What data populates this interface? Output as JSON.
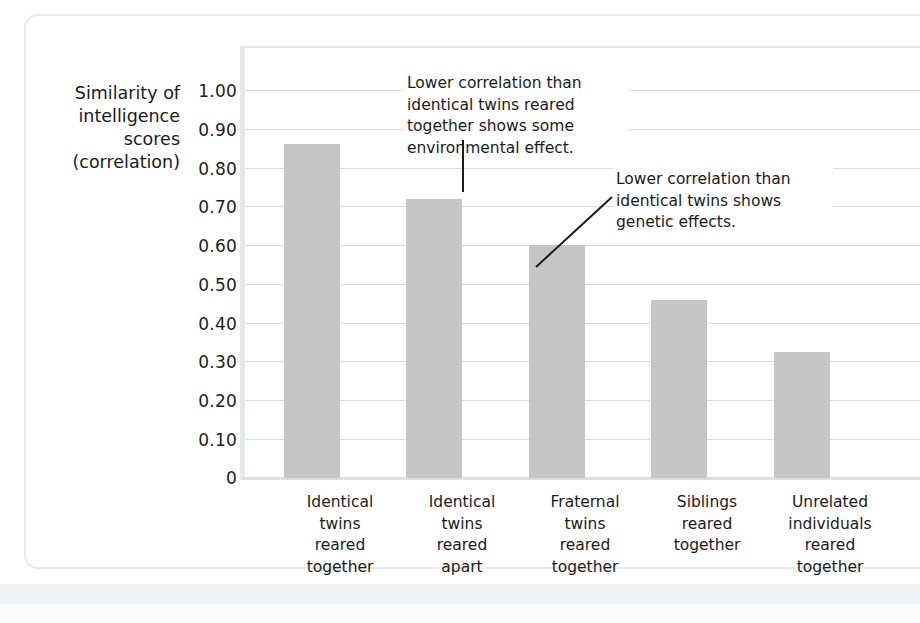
{
  "chart_data": {
    "type": "bar",
    "title": "",
    "subtitle": "",
    "xlabel": "",
    "ylabel": "Similarity of intelligence scores (correlation)",
    "ylabel_lines": [
      "Similarity of",
      "intelligence",
      "scores",
      "(correlation)"
    ],
    "ylim": [
      0,
      1.0
    ],
    "grid": true,
    "legend": "none",
    "yticks": [
      "1.00",
      "0.90",
      "0.80",
      "0.70",
      "0.60",
      "0.50",
      "0.40",
      "0.30",
      "0.20",
      "0.10",
      "0"
    ],
    "ytick_values": [
      1.0,
      0.9,
      0.8,
      0.7,
      0.6,
      0.5,
      0.4,
      0.3,
      0.2,
      0.1,
      0
    ],
    "categories": [
      "Identical twins reared together",
      "Identical twins reared apart",
      "Fraternal twins reared together",
      "Siblings reared together",
      "Unrelated individuals reared together"
    ],
    "category_lines": [
      [
        "Identical",
        "twins",
        "reared",
        "together"
      ],
      [
        "Identical",
        "twins",
        "reared",
        "apart"
      ],
      [
        "Fraternal",
        "twins",
        "reared",
        "together"
      ],
      [
        "Siblings",
        "reared",
        "together"
      ],
      [
        "Unrelated",
        "individuals",
        "reared",
        "together"
      ]
    ],
    "values": [
      0.86,
      0.72,
      0.6,
      0.46,
      0.325
    ],
    "bar_color": "#c6c6c6",
    "gridline_color": "#d9dbdd",
    "annotations": [
      {
        "id": "annotation-1",
        "text": "Lower correlation than identical twins reared together shows some environmental effect.",
        "lines": [
          "Lower correlation than",
          "identical twins reared",
          "together shows some",
          "environmental effect."
        ],
        "points_to_category": "Identical twins reared apart"
      },
      {
        "id": "annotation-2",
        "text": "Lower correlation than identical twins shows genetic effects.",
        "lines": [
          "Lower correlation than",
          "identical twins shows",
          "genetic effects."
        ],
        "points_to_category": "Fraternal twins reared together"
      }
    ]
  },
  "ylabel": {
    "line1": "Similarity of",
    "line2": "intelligence",
    "line3": "scores",
    "line4": "(correlation)"
  },
  "yticks": {
    "t0": "1.00",
    "t1": "0.90",
    "t2": "0.80",
    "t3": "0.70",
    "t4": "0.60",
    "t5": "0.50",
    "t6": "0.40",
    "t7": "0.30",
    "t8": "0.20",
    "t9": "0.10",
    "t10": "0"
  },
  "xlabels": {
    "c0l0": "Identical",
    "c0l1": "twins",
    "c0l2": "reared",
    "c0l3": "together",
    "c1l0": "Identical",
    "c1l1": "twins",
    "c1l2": "reared",
    "c1l3": "apart",
    "c2l0": "Fraternal",
    "c2l1": "twins",
    "c2l2": "reared",
    "c2l3": "together",
    "c3l0": "Siblings",
    "c3l1": "reared",
    "c3l2": "together",
    "c3l3": "",
    "c4l0": "Unrelated",
    "c4l1": "individuals",
    "c4l2": "reared",
    "c4l3": "together"
  },
  "annotations": {
    "a1l0": "Lower correlation than",
    "a1l1": "identical twins reared",
    "a1l2": "together shows some",
    "a1l3": "environmental effect.",
    "a2l0": "Lower correlation than",
    "a2l1": "identical twins shows",
    "a2l2": "genetic effects."
  }
}
